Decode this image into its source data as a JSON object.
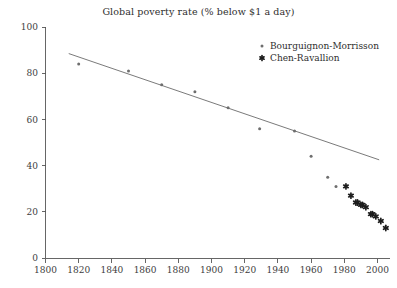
{
  "chart_data": {
    "type": "scatter",
    "title": "Global poverty rate (% below $1 a day)",
    "xlabel": "",
    "ylabel": "",
    "xlim": [
      1800,
      2010
    ],
    "ylim": [
      0,
      100
    ],
    "xticks": [
      1800,
      1820,
      1840,
      1860,
      1880,
      1900,
      1920,
      1940,
      1960,
      1980,
      2000
    ],
    "yticks": [
      0,
      20,
      40,
      60,
      80,
      100
    ],
    "grid": false,
    "legend_position": "top-right",
    "series": [
      {
        "name": "Bourguignon-Morrisson",
        "marker": "dot",
        "color": "#6e6e6e",
        "points": [
          {
            "x": 1820,
            "y": 84
          },
          {
            "x": 1850,
            "y": 81
          },
          {
            "x": 1870,
            "y": 75
          },
          {
            "x": 1890,
            "y": 72
          },
          {
            "x": 1910,
            "y": 65
          },
          {
            "x": 1929,
            "y": 56
          },
          {
            "x": 1950,
            "y": 55
          },
          {
            "x": 1960,
            "y": 44
          },
          {
            "x": 1970,
            "y": 35
          },
          {
            "x": 1975,
            "y": 31
          }
        ]
      },
      {
        "name": "Chen-Ravallion",
        "marker": "asterisk",
        "color": "#1d1d1d",
        "points": [
          {
            "x": 1981,
            "y": 31
          },
          {
            "x": 1984,
            "y": 27
          },
          {
            "x": 1987,
            "y": 24
          },
          {
            "x": 1988,
            "y": 24
          },
          {
            "x": 1990,
            "y": 23
          },
          {
            "x": 1991,
            "y": 23
          },
          {
            "x": 1993,
            "y": 22
          },
          {
            "x": 1996,
            "y": 19
          },
          {
            "x": 1997,
            "y": 19
          },
          {
            "x": 1999,
            "y": 18
          },
          {
            "x": 2002,
            "y": 16
          },
          {
            "x": 2005,
            "y": 13
          }
        ]
      }
    ],
    "trend_line": {
      "name": "linear-trend",
      "color": "#6b6b6b",
      "x_start": 1814,
      "y_start": 88.5,
      "x_end": 2001,
      "y_end": 42.5
    }
  },
  "legend": {
    "entries": [
      {
        "label": "Bourguignon-Morrisson",
        "marker": "dot"
      },
      {
        "label": "Chen-Ravallion",
        "marker": "asterisk"
      }
    ]
  },
  "axis": {
    "y_tick_labels": [
      "100",
      "80",
      "60",
      "40",
      "20",
      "0"
    ],
    "x_tick_labels": [
      "1800",
      "1820",
      "1840",
      "1860",
      "1880",
      "1900",
      "1920",
      "1940",
      "1960",
      "1980",
      "2000"
    ]
  }
}
